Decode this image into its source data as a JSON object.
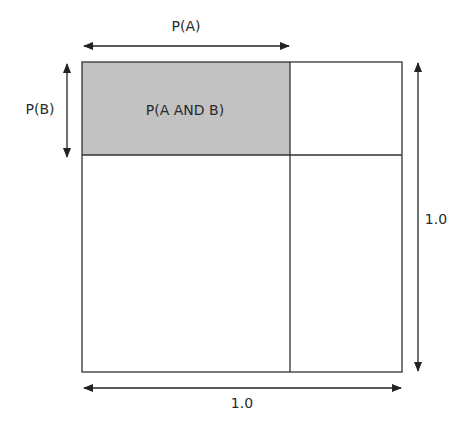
{
  "diagram": {
    "labels": {
      "top": "P(A)",
      "left": "P(B)",
      "center": "P(A AND B)",
      "right": "1.0",
      "bottom": "1.0"
    },
    "colors": {
      "shaded": "#c2c2c2",
      "line": "#333333",
      "background": "#ffffff"
    }
  }
}
